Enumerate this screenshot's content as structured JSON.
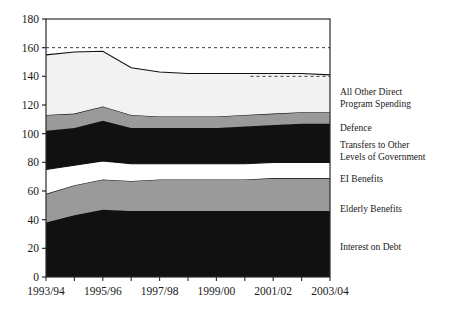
{
  "chart_data": {
    "type": "area",
    "title": "",
    "subtitle": "",
    "xlabel": "",
    "ylabel": "",
    "stacked": true,
    "grid": false,
    "legend_position": "right",
    "ylim": [
      0,
      180
    ],
    "yticks": [
      0,
      20,
      40,
      60,
      80,
      100,
      120,
      140,
      160,
      180
    ],
    "xticks": [
      "1993/94",
      "1995/96",
      "1997/98",
      "1999/00",
      "2001/02",
      "2003/04"
    ],
    "categories": [
      "1993/94",
      "1994/95",
      "1995/96",
      "1996/97",
      "1997/98",
      "1998/99",
      "1999/00",
      "2000/01",
      "2001/02",
      "2002/03",
      "2003/04"
    ],
    "reference_lines": [
      {
        "value": 160,
        "style": "dashed",
        "span": "full"
      },
      {
        "value": 140,
        "style": "dashed",
        "span": "right"
      }
    ],
    "series": [
      {
        "name": "Interest on Debt",
        "color": "#111111",
        "values": [
          38,
          43,
          47,
          46,
          46,
          46,
          46,
          46,
          46,
          46,
          46
        ]
      },
      {
        "name": "Elderly Benefits",
        "color": "#9a9a9a",
        "values": [
          20,
          21,
          21,
          21,
          22,
          22,
          22,
          22,
          23,
          23,
          23
        ]
      },
      {
        "name": "EI Benefits",
        "color": "#ffffff",
        "values": [
          17,
          14,
          13,
          12,
          11,
          11,
          11,
          11,
          11,
          11,
          11
        ]
      },
      {
        "name": "Transfers to Other Levels of Government",
        "color": "#111111",
        "values": [
          27,
          26,
          28,
          25,
          25,
          25,
          25,
          26,
          26,
          27,
          27
        ]
      },
      {
        "name": "Defence",
        "color": "#9a9a9a",
        "values": [
          11,
          10,
          10,
          9,
          8,
          8,
          8,
          8,
          8,
          8,
          8
        ]
      },
      {
        "name": "All Other Direct Program Spending",
        "color": "#f2f2f2",
        "values": [
          42,
          43,
          38.5,
          33,
          31,
          30,
          30,
          29,
          28,
          27,
          26
        ]
      }
    ]
  },
  "axis": {
    "y_labels": [
      "180",
      "160",
      "140",
      "120",
      "100",
      "80",
      "60",
      "40",
      "20",
      "0"
    ],
    "x_labels": [
      "1993/94",
      "1995/96",
      "1997/98",
      "1999/00",
      "2001/02",
      "2003/04"
    ]
  },
  "legend": {
    "items": [
      {
        "id": "all-other-direct-program-spending",
        "line1": "All Other Direct",
        "line2": "Program Spending"
      },
      {
        "id": "defence",
        "line1": "Defence",
        "line2": ""
      },
      {
        "id": "transfers-to-other-levels-of-government",
        "line1": "Transfers to Other",
        "line2": "Levels of Government"
      },
      {
        "id": "ei-benefits",
        "line1": "EI Benefits",
        "line2": ""
      },
      {
        "id": "elderly-benefits",
        "line1": "Elderly Benefits",
        "line2": ""
      },
      {
        "id": "interest-on-debt",
        "line1": "Interest on Debt",
        "line2": ""
      }
    ]
  },
  "colors": {
    "dark": "#111111",
    "gray": "#9a9a9a",
    "white": "#ffffff",
    "offwhite": "#f2f2f2",
    "axis": "#2b2b2b"
  }
}
